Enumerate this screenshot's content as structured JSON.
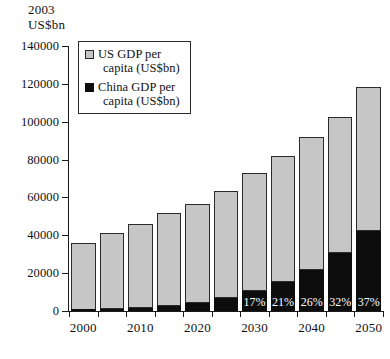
{
  "axis_title": "2003\nUS$bn",
  "legend": {
    "items": [
      {
        "name": "us-gdp",
        "label_line1": "US GDP per",
        "label_line2": "capita (US$bn)",
        "color": "#c6c6c6"
      },
      {
        "name": "china-gdp",
        "label_line1": "China GDP per",
        "label_line2": "capita (US$bn)",
        "color": "#0d0d0d"
      }
    ]
  },
  "chart_data": {
    "type": "bar",
    "title": "",
    "subtitle": "",
    "xlabel": "",
    "ylabel": "2003 US$bn",
    "ylim": [
      0,
      140000
    ],
    "ytick_values": [
      0,
      20000,
      40000,
      60000,
      80000,
      100000,
      120000,
      140000
    ],
    "ytick_labels": [
      "0",
      "20000",
      "40000",
      "60000",
      "80000",
      "100000",
      "120000",
      "140000"
    ],
    "grid": false,
    "stacked": true,
    "legend_position": "top-left-inside",
    "categories": [
      "2000",
      "2005",
      "2010",
      "2015",
      "2020",
      "2025",
      "2030",
      "2035",
      "2040",
      "2045",
      "2050"
    ],
    "xtick_labels": [
      "2000",
      "",
      "2010",
      "",
      "2020",
      "",
      "2030",
      "",
      "2040",
      "",
      "2050"
    ],
    "series": [
      {
        "name": "US GDP per capita (US$bn)",
        "color": "#c6c6c6",
        "values": [
          35500,
          40300,
          44500,
          49200,
          52600,
          56500,
          62200,
          66700,
          70000,
          72100,
          76300
        ]
      },
      {
        "name": "China GDP per capita (US$bn)",
        "color": "#0d0d0d",
        "values": [
          500,
          900,
          1600,
          2600,
          4000,
          6700,
          10700,
          15300,
          21900,
          30500,
          42100
        ]
      }
    ],
    "totals": [
      36000,
      41200,
      46100,
      51800,
      56600,
      63200,
      72900,
      82000,
      91900,
      102600,
      118400
    ],
    "annotations": [
      {
        "category": "2030",
        "text": "17%",
        "series": "China GDP per capita (US$bn)"
      },
      {
        "category": "2035",
        "text": "21%",
        "series": "China GDP per capita (US$bn)"
      },
      {
        "category": "2040",
        "text": "26%",
        "series": "China GDP per capita (US$bn)"
      },
      {
        "category": "2045",
        "text": "32%",
        "series": "China GDP per capita (US$bn)"
      },
      {
        "category": "2050",
        "text": "37%",
        "series": "China GDP per capita (US$bn)"
      }
    ]
  }
}
